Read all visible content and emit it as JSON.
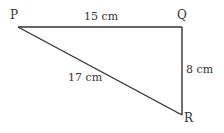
{
  "diagram": {
    "type": "right triangle",
    "vertices": {
      "P": {
        "label": "P"
      },
      "Q": {
        "label": "Q"
      },
      "R": {
        "label": "R"
      }
    },
    "sides": {
      "PQ": {
        "label": "15 cm"
      },
      "QR": {
        "label": "8 cm"
      },
      "PR": {
        "label": "17 cm"
      }
    },
    "line_color": "#333333"
  }
}
